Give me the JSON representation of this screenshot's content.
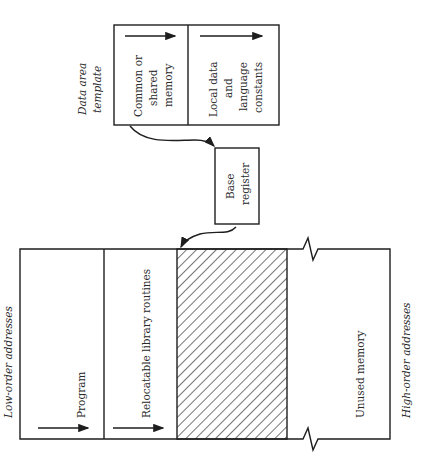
{
  "diagram": {
    "orientation": "rotated 90 degrees counter-clockwise",
    "data_area_template": {
      "caption": [
        "Data area",
        "template"
      ],
      "cells": [
        {
          "label": [
            "Common or",
            "shared",
            "memory"
          ]
        },
        {
          "label": [
            "Local data",
            "and",
            "language",
            "constants"
          ]
        }
      ]
    },
    "base_register": {
      "label": [
        "Base",
        "register"
      ]
    },
    "memory_map": {
      "low_label": "Low-order addresses",
      "high_label": "High-order addresses",
      "regions": [
        {
          "name": "program",
          "label": "Program"
        },
        {
          "name": "relocatable-library",
          "label": "Relocatable library routines"
        },
        {
          "name": "data-area",
          "label": "",
          "hatched": true
        },
        {
          "name": "unused",
          "label": "Unused memory"
        }
      ]
    }
  }
}
